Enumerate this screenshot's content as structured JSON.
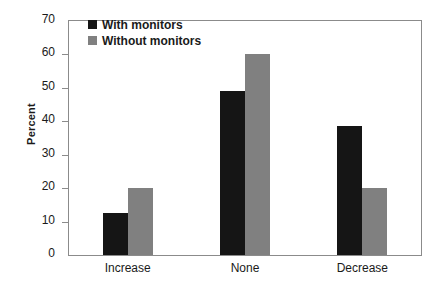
{
  "chart_data": {
    "type": "bar",
    "title": "",
    "subtitle": "",
    "xlabel": "",
    "ylabel": "Percent",
    "categories": [
      "Increase",
      "None",
      "Decrease"
    ],
    "series": [
      {
        "name": "With monitors",
        "color": "#151515",
        "values": [
          12.5,
          49,
          38.5
        ]
      },
      {
        "name": "Without monitors",
        "color": "#808080",
        "values": [
          20,
          60,
          20
        ]
      }
    ],
    "ylim": [
      0,
      70
    ],
    "ytick_step": 10,
    "yticks": [
      0,
      10,
      20,
      30,
      40,
      50,
      60,
      70
    ],
    "ytick_labels": [
      "0",
      "10",
      "20",
      "30",
      "40",
      "50",
      "60",
      "70"
    ],
    "grid": false,
    "legend_position": "top-left-inside",
    "frame": true,
    "bar_group_gap": true
  },
  "legend": {
    "entries": [
      {
        "label": "With monitors",
        "swatch": "black-square-swatch"
      },
      {
        "label": "Without monitors",
        "swatch": "gray-square-swatch"
      }
    ]
  },
  "colors": {
    "series_with_monitors": "#151515",
    "series_without_monitors": "#808080",
    "axis": "#8b8b8b",
    "text": "#1a1a1a",
    "background": "#ffffff"
  }
}
